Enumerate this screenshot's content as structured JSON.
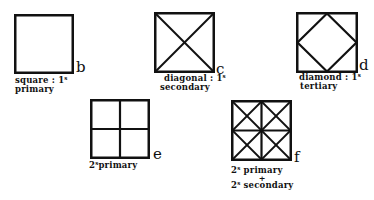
{
  "figures": [
    {
      "id": "b",
      "letter": "b",
      "pattern": "square",
      "caption_lines": [
        [
          "square : 1",
          "s"
        ],
        [
          "primary",
          ""
        ]
      ]
    },
    {
      "id": "c",
      "letter": "c",
      "pattern": "diagonal",
      "caption_lines": [
        [
          "diagonal : 1",
          "s"
        ],
        [
          "secondary",
          ""
        ]
      ]
    },
    {
      "id": "d",
      "letter": "d",
      "pattern": "diamond",
      "caption_lines": [
        [
          "diamond : 1",
          "s"
        ],
        [
          "tertiary",
          ""
        ]
      ]
    },
    {
      "id": "e",
      "letter": "e",
      "pattern": "grid-2x2",
      "caption_lines": [
        [
          "2",
          "s"
        ],
        [
          "primary",
          ""
        ]
      ]
    },
    {
      "id": "f",
      "letter": "f",
      "pattern": "grid-2x2-with-diagonals",
      "caption_lines": [
        [
          "2",
          "s"
        ],
        [
          "primary",
          ""
        ],
        [
          "+",
          ""
        ],
        [
          "2",
          "s"
        ],
        [
          "secondary",
          ""
        ]
      ]
    }
  ],
  "labels": {
    "b": {
      "letter": "b",
      "line1": "square : 1",
      "sup1": "s",
      "line2": "primary"
    },
    "c": {
      "letter": "c",
      "line1": "diagonal : 1",
      "sup1": "s",
      "line2": "secondary"
    },
    "d": {
      "letter": "d",
      "line1": "diamond : 1",
      "sup1": "s",
      "line2": "tertiary"
    },
    "e": {
      "letter": "e",
      "num": "2",
      "sup": "s",
      "line": "primary"
    },
    "f": {
      "letter": "f",
      "num1": "2",
      "sup1": "s",
      "line1": "primary",
      "plus": "+",
      "num2": "2",
      "sup2": "s",
      "line2": "secondary"
    }
  },
  "colors": {
    "stroke": "#111111",
    "background": "#ffffff"
  }
}
